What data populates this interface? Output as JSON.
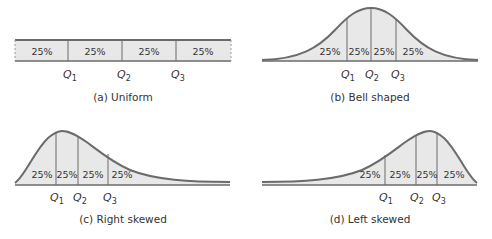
{
  "colors": {
    "fill": "#e8e8e8",
    "stroke": "#6b6b6b",
    "text": "#333333"
  },
  "panels": [
    {
      "id": "a",
      "caption": "(a)  Uniform",
      "shape": "uniform",
      "segments": [
        "25%",
        "25%",
        "25%",
        "25%"
      ],
      "quartiles": [
        {
          "label": "Q",
          "sub": "1"
        },
        {
          "label": "Q",
          "sub": "2"
        },
        {
          "label": "Q",
          "sub": "3"
        }
      ]
    },
    {
      "id": "b",
      "caption": "(b)  Bell shaped",
      "shape": "bell",
      "segments": [
        "25%",
        "25%",
        "25%",
        "25%"
      ],
      "quartiles": [
        {
          "label": "Q",
          "sub": "1"
        },
        {
          "label": "Q",
          "sub": "2"
        },
        {
          "label": "Q",
          "sub": "3"
        }
      ]
    },
    {
      "id": "c",
      "caption": "(c)  Right skewed",
      "shape": "right-skewed",
      "segments": [
        "25%",
        "25%",
        "25%",
        "25%"
      ],
      "quartiles": [
        {
          "label": "Q",
          "sub": "1"
        },
        {
          "label": "Q",
          "sub": "2"
        },
        {
          "label": "Q",
          "sub": "3"
        }
      ]
    },
    {
      "id": "d",
      "caption": "(d)  Left skewed",
      "shape": "left-skewed",
      "segments": [
        "25%",
        "25%",
        "25%",
        "25%"
      ],
      "quartiles": [
        {
          "label": "Q",
          "sub": "1"
        },
        {
          "label": "Q",
          "sub": "2"
        },
        {
          "label": "Q",
          "sub": "3"
        }
      ]
    }
  ]
}
